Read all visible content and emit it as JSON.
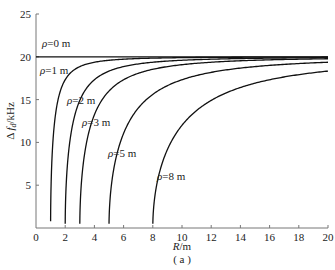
{
  "chart_data": {
    "type": "line",
    "title": "",
    "subtitle": "(a)",
    "xlabel": "R/m",
    "ylabel": "Δ f_d /kHz",
    "xlim": [
      0,
      20
    ],
    "ylim": [
      0,
      25
    ],
    "xticks": [
      0,
      2,
      4,
      6,
      8,
      10,
      12,
      14,
      16,
      18,
      20
    ],
    "yticks": [
      5,
      10,
      15,
      20,
      25
    ],
    "grid": false,
    "legend": "inline labels",
    "series": [
      {
        "name": "ρ=0 m",
        "rho": 0,
        "x": [
          0,
          20
        ],
        "values": [
          20,
          20
        ]
      },
      {
        "name": "ρ=1 m",
        "rho": 1,
        "x": [
          1.0,
          1.05,
          1.2,
          1.5,
          2,
          3,
          5,
          10,
          20
        ],
        "values": [
          0.8,
          6.1,
          11.1,
          14.9,
          17.3,
          18.9,
          19.6,
          19.9,
          19.95
        ]
      },
      {
        "name": "ρ=2 m",
        "rho": 2,
        "x": [
          2.0,
          2.1,
          2.4,
          3,
          4,
          6,
          10,
          20
        ],
        "values": [
          0.5,
          6.1,
          11.1,
          14.9,
          17.3,
          18.9,
          19.6,
          19.9
        ]
      },
      {
        "name": "ρ=3 m",
        "rho": 3,
        "x": [
          3.0,
          3.15,
          3.6,
          4.5,
          6,
          9,
          14,
          20
        ],
        "values": [
          0.5,
          6.1,
          11.1,
          14.9,
          17.3,
          18.9,
          19.5,
          19.8
        ]
      },
      {
        "name": "ρ=5 m",
        "rho": 5,
        "x": [
          5.0,
          5.25,
          6,
          7.5,
          10,
          15,
          20
        ],
        "values": [
          0.5,
          6.1,
          11.1,
          14.9,
          17.3,
          18.9,
          19.4
        ]
      },
      {
        "name": "ρ=8 m",
        "rho": 8,
        "x": [
          8.0,
          8.4,
          9.6,
          12,
          16,
          20
        ],
        "values": [
          0.5,
          6.1,
          11.1,
          14.9,
          17.3,
          18.3
        ]
      }
    ],
    "annotations": [
      "ρ=0 m",
      "ρ=1 m",
      "ρ=2 m",
      "ρ=3 m",
      "ρ=5 m",
      "ρ=8 m"
    ]
  },
  "labels": {
    "xlabel": "R/m",
    "ylabel": "Δ fd/kHz",
    "caption": "( a )"
  },
  "style": {
    "axis_color": "#777777",
    "curve_color": "#111111"
  }
}
